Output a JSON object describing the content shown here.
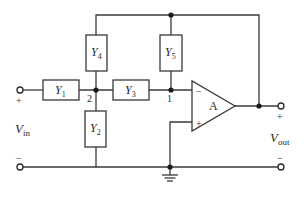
{
  "diagram": {
    "type": "circuit",
    "components": {
      "Y1": {
        "letter": "Y",
        "sub": "1"
      },
      "Y2": {
        "letter": "Y",
        "sub": "2"
      },
      "Y3": {
        "letter": "Y",
        "sub": "3"
      },
      "Y4": {
        "letter": "Y",
        "sub": "4"
      },
      "Y5": {
        "letter": "Y",
        "sub": "5"
      }
    },
    "opamp": {
      "label": "A",
      "inverting_sign": "−",
      "noninverting_sign": "+"
    },
    "nodes": {
      "node1": "1",
      "node2": "2"
    },
    "input": {
      "letter": "V",
      "sub": "in",
      "plus": "+",
      "minus": "−"
    },
    "output": {
      "letter": "V",
      "sub": "out",
      "plus": "+",
      "minus": "−"
    },
    "colors": {
      "wire": "#3a3a3a",
      "text": "#2a2a2a",
      "background": "#ffffff"
    }
  }
}
